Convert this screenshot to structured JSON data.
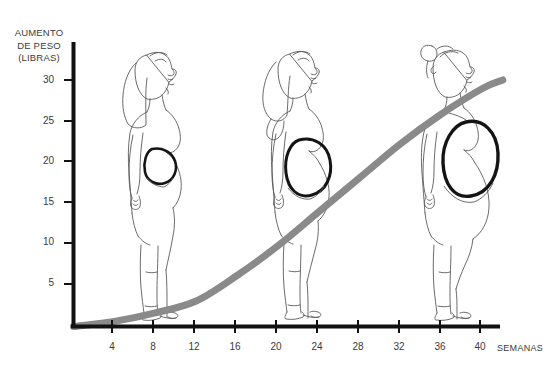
{
  "chart_data": {
    "type": "line",
    "title": "AUMENTO DE PESO (LIBRAS)",
    "title_lines": [
      "AUMENTO",
      "DE PESO",
      "(LIBRAS)"
    ],
    "ylabel": "AUMENTO DE PESO (LIBRAS)",
    "xlabel": "SEMANAS",
    "xticks": [
      4,
      8,
      12,
      16,
      20,
      24,
      28,
      32,
      36,
      40
    ],
    "xtick_labels": [
      "4",
      "8",
      "12",
      "16",
      "20",
      "24",
      "28",
      "32",
      "36",
      "40"
    ],
    "yticks": [
      5,
      10,
      15,
      20,
      25,
      30
    ],
    "ytick_labels": [
      "5",
      "10",
      "15",
      "20",
      "25",
      "30"
    ],
    "xlim": [
      0,
      42
    ],
    "ylim": [
      0,
      33
    ],
    "grid": false,
    "legend": null,
    "series": [
      {
        "name": "Aumento de peso",
        "color": "#8a8a8a",
        "line_width": 7,
        "x": [
          0,
          4,
          8,
          12,
          16,
          20,
          24,
          28,
          32,
          36,
          40,
          42
        ],
        "values": [
          0,
          0.6,
          1.6,
          3.0,
          6.0,
          9.5,
          13.5,
          17.5,
          21.5,
          25.0,
          28.0,
          29.0
        ]
      }
    ],
    "annotations": [
      {
        "name": "figure-first-trimester",
        "label": "Mujer embarazada de perfil, utero pequeno",
        "week": 10
      },
      {
        "name": "figure-second-trimester",
        "label": "Mujer embarazada de perfil, utero mediano",
        "week": 22
      },
      {
        "name": "figure-third-trimester",
        "label": "Mujer embarazada de perfil, utero grande",
        "week": 36
      }
    ]
  },
  "axis": {
    "line_color": "#111111",
    "curve_color": "#8a8a8a"
  }
}
